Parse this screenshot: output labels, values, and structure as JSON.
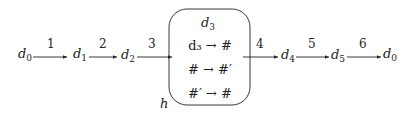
{
  "diagram": {
    "nodes": [
      {
        "id": "n0",
        "base": "d",
        "sub": "0"
      },
      {
        "id": "n1",
        "base": "d",
        "sub": "1"
      },
      {
        "id": "n2",
        "base": "d",
        "sub": "2"
      },
      {
        "id": "n4",
        "base": "d",
        "sub": "4"
      },
      {
        "id": "n5",
        "base": "d",
        "sub": "5"
      },
      {
        "id": "n6",
        "base": "d",
        "sub": "0"
      }
    ],
    "edges": [
      {
        "label": "1"
      },
      {
        "label": "2"
      },
      {
        "label": "3"
      },
      {
        "label": "4"
      },
      {
        "label": "5"
      },
      {
        "label": "6"
      }
    ],
    "box": {
      "label": "h",
      "title_base": "d",
      "title_sub": "3",
      "rules": [
        "d₃ → #",
        "# → #′",
        "#′ → #"
      ]
    },
    "colors": {
      "stroke": "#222222",
      "text": "#222222"
    }
  }
}
